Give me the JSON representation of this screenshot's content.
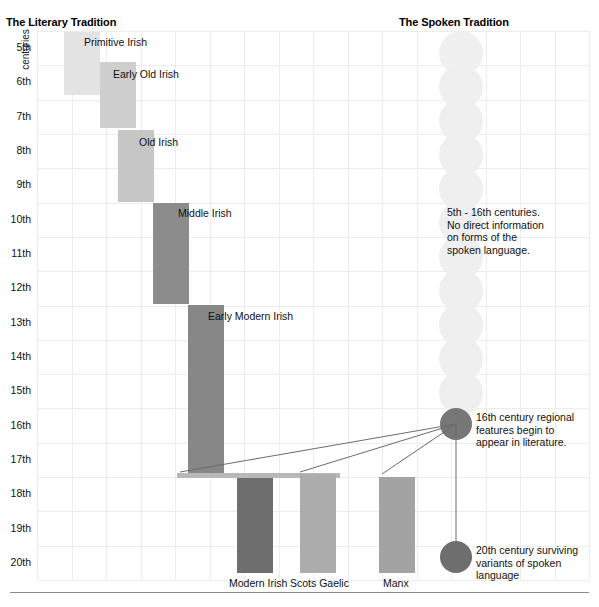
{
  "columns": {
    "literary_heading": "The Literary Tradition",
    "spoken_heading": "The Spoken Tradition"
  },
  "axis": {
    "label": "centuries",
    "ticks": [
      "5th",
      "6th",
      "7th",
      "8th",
      "9th",
      "10th",
      "11th",
      "12th",
      "13th",
      "14th",
      "15th",
      "16th",
      "17th",
      "18th",
      "19th",
      "20th"
    ]
  },
  "chart_data": {
    "type": "bar",
    "xlabel": "",
    "ylabel": "centuries",
    "ylim": [
      5,
      21
    ],
    "grid": true,
    "orientation": "vertical-timeline",
    "categories": [
      "Primitive Irish",
      "Early Old Irish",
      "Old Irish",
      "Middle Irish",
      "Early Modern Irish",
      "Modern Irish",
      "Scots Gaelic",
      "Manx"
    ],
    "series": [
      {
        "name": "literary periods",
        "values": [
          {
            "label": "Primitive Irish",
            "start_century": 5,
            "end_century": 7,
            "color": "#e3e3e3"
          },
          {
            "label": "Early Old Irish",
            "start_century": 6,
            "end_century": 8,
            "color": "#cfcfcf"
          },
          {
            "label": "Old Irish",
            "start_century": 8,
            "end_century": 10,
            "color": "#c6c6c6"
          },
          {
            "label": "Middle Irish",
            "start_century": 10,
            "end_century": 13,
            "color": "#8c8c8c"
          },
          {
            "label": "Early Modern Irish",
            "start_century": 13,
            "end_century": 18,
            "color": "#878787"
          },
          {
            "label": "Modern Irish",
            "start_century": 18,
            "end_century": 21,
            "color": "#6e6e6e"
          },
          {
            "label": "Scots Gaelic",
            "start_century": 18,
            "end_century": 21,
            "color": "#acacac"
          },
          {
            "label": "Manx",
            "start_century": 18,
            "end_century": 21,
            "color": "#a3a3a3"
          }
        ]
      }
    ]
  },
  "bars": [
    {
      "name": "primitive-irish",
      "label": "Primitive Irish",
      "x": 64,
      "y": 32,
      "w": 36,
      "h": 63,
      "color": "#e3e3e3",
      "label_x": 84,
      "label_y": 36
    },
    {
      "name": "early-old-irish",
      "label": "Early Old Irish",
      "x": 100,
      "y": 62,
      "w": 36,
      "h": 66,
      "color": "#cfcfcf",
      "label_x": 113,
      "label_y": 68
    },
    {
      "name": "old-irish",
      "label": "Old Irish",
      "x": 118,
      "y": 130,
      "w": 36,
      "h": 72,
      "color": "#c6c6c6",
      "label_x": 139,
      "label_y": 136
    },
    {
      "name": "middle-irish",
      "label": "Middle Irish",
      "x": 153,
      "y": 203,
      "w": 36,
      "h": 101,
      "color": "#8c8c8c",
      "label_x": 178,
      "label_y": 207
    },
    {
      "name": "early-modern-irish",
      "label": "Early Modern Irish",
      "x": 188,
      "y": 305,
      "w": 36,
      "h": 168,
      "color": "#878787",
      "label_x": 208,
      "label_y": 310
    },
    {
      "name": "modern-irish",
      "label": "Modern Irish",
      "x": 237,
      "y": 478,
      "w": 36,
      "h": 95,
      "color": "#6e6e6e",
      "label_x": 229,
      "label_y": 577
    },
    {
      "name": "scots-gaelic",
      "label": "Scots Gaelic",
      "x": 300,
      "y": 474,
      "w": 36,
      "h": 99,
      "color": "#acacac",
      "label_x": 290,
      "label_y": 577
    },
    {
      "name": "manx",
      "label": "Manx",
      "x": 379,
      "y": 477,
      "w": 36,
      "h": 96,
      "color": "#a3a3a3",
      "label_x": 383,
      "label_y": 577
    }
  ],
  "connector_bar": {
    "name": "seventeenth-century-connector",
    "x": 177,
    "y": 473,
    "w": 163,
    "h": 5,
    "color": "#b8b8b8"
  },
  "spoken": {
    "dots": [
      {
        "cx": 461,
        "cy": 53,
        "r": 22,
        "color": "#f0f0f0"
      },
      {
        "cx": 461,
        "cy": 87,
        "r": 22,
        "color": "#efefef"
      },
      {
        "cx": 461,
        "cy": 121,
        "r": 22,
        "color": "#efefef"
      },
      {
        "cx": 461,
        "cy": 155,
        "r": 22,
        "color": "#efefef"
      },
      {
        "cx": 461,
        "cy": 189,
        "r": 22,
        "color": "#efefef"
      },
      {
        "cx": 461,
        "cy": 223,
        "r": 22,
        "color": "#efefef"
      },
      {
        "cx": 461,
        "cy": 257,
        "r": 22,
        "color": "#efefef"
      },
      {
        "cx": 461,
        "cy": 291,
        "r": 22,
        "color": "#efefef"
      },
      {
        "cx": 461,
        "cy": 325,
        "r": 22,
        "color": "#efefef"
      },
      {
        "cx": 461,
        "cy": 359,
        "r": 22,
        "color": "#efefef"
      },
      {
        "cx": 461,
        "cy": 393,
        "r": 22,
        "color": "#efefef"
      }
    ],
    "marker_16th": {
      "cx": 456,
      "cy": 424,
      "r": 16,
      "color": "#777777"
    },
    "marker_20th": {
      "cx": 456,
      "cy": 557,
      "r": 16,
      "color": "#6e6e6e"
    }
  },
  "notes": {
    "no_information": "5th - 16th centuries.\nNo direct information\non forms of the\nspoken language.",
    "note_16th": "16th century regional\nfeatures begin to\nappear in literature.",
    "note_20th": "20th century surviving\nvariants of spoken\nlanguage"
  }
}
